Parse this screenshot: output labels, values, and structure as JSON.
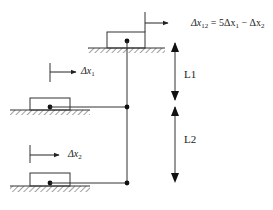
{
  "diagram": {
    "equation": {
      "lhs_symbol": "Δx",
      "lhs_subscript": "12",
      "rhs": "= 5Δx",
      "rhs_sub1": "1",
      "rhs_minus": " − Δx",
      "rhs_sub2": "2"
    },
    "labels": {
      "dx1_symbol": "Δx",
      "dx1_sub": "1",
      "dx2_symbol": "Δx",
      "dx2_sub": "2",
      "L1": "L1",
      "L2": "L2"
    },
    "colors": {
      "line": "#333333",
      "background": "#ffffff"
    }
  }
}
